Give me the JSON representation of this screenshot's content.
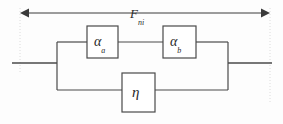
{
  "diagram": {
    "force_arrow": {
      "symbol": "F",
      "subscript": "ni",
      "direction": "double-headed",
      "span_px": [
        20,
        270
      ],
      "y_px": 13
    },
    "elements": [
      {
        "id": "alpha-a",
        "symbol": "α",
        "subscript": "a",
        "branch": "top",
        "order": 1,
        "rect_px": [
          87,
          26,
          31,
          32
        ]
      },
      {
        "id": "alpha-b",
        "symbol": "α",
        "subscript": "b",
        "branch": "top",
        "order": 2,
        "rect_px": [
          163,
          26,
          33,
          32
        ]
      },
      {
        "id": "eta",
        "symbol": "η",
        "subscript": "",
        "branch": "bottom",
        "order": 1,
        "rect_px": [
          122,
          73,
          33,
          39
        ]
      }
    ],
    "topology": {
      "description": "alpha-a in series with alpha-b on the upper branch, in parallel with eta on the lower branch",
      "left_node_x": 57,
      "right_node_x": 228,
      "main_rail_y": 63,
      "top_branch_y": 42,
      "bottom_branch_y": 90,
      "terminal_left_x": 12,
      "terminal_right_x": 272
    },
    "colors": {
      "stroke": "#3a3a3a",
      "text": "#2a2a2a",
      "background": "#fdfdfd",
      "guide": "#d8d8d8"
    }
  }
}
